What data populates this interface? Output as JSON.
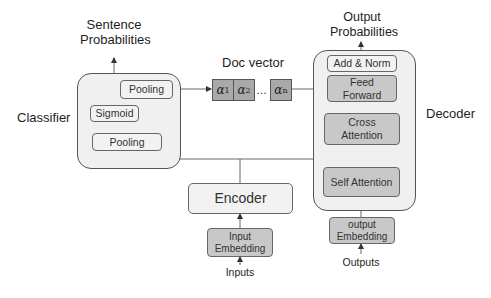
{
  "classifier": {
    "title": "Classifier",
    "output_label_line1": "Sentence",
    "output_label_line2": "Probabilities",
    "boxes": {
      "pooling_top": "Pooling",
      "sigmoid": "Sigmoid",
      "pooling_bottom": "Pooling"
    }
  },
  "doc_vector": {
    "title": "Doc vector",
    "elements": [
      {
        "symbol": "α",
        "sub": "1"
      },
      {
        "symbol": "α",
        "sub": "2"
      },
      {
        "symbol": "α",
        "sub": "n"
      }
    ],
    "ellipsis": "…"
  },
  "encoder": {
    "title": "Encoder",
    "embedding_line1": "Input",
    "embedding_line2": "Embedding",
    "input_label": "Inputs"
  },
  "decoder": {
    "title": "Decoder",
    "output_label_line1": "Output",
    "output_label_line2": "Probabilities",
    "boxes": {
      "add_norm": "Add & Norm",
      "feed_forward_line1": "Feed",
      "feed_forward_line2": "Forward",
      "cross_attention_line1": "Cross",
      "cross_attention_line2": "Attention",
      "self_attention": "Self Attention"
    },
    "embedding_line1": "output",
    "embedding_line2": "Embedding",
    "input_label": "Outputs"
  },
  "colors": {
    "container_fill": "#f0f0f0",
    "light_box": "#f2f2f2",
    "dark_box": "#c8c8c8",
    "vector_fill": "#a9a9a9",
    "line": "#555555"
  }
}
